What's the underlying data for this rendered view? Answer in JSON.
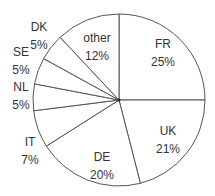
{
  "chart_data": {
    "type": "pie",
    "title": "",
    "start_angle_deg": 0,
    "direction": "clockwise",
    "slices": [
      {
        "label": "FR",
        "value": 25,
        "pct_label": "25%",
        "lx": 163,
        "ly": 48,
        "ly2": 66
      },
      {
        "label": "UK",
        "value": 21,
        "pct_label": "21%",
        "lx": 168,
        "ly": 135,
        "ly2": 153
      },
      {
        "label": "DE",
        "value": 20,
        "pct_label": "20%",
        "lx": 102,
        "ly": 161,
        "ly2": 179
      },
      {
        "label": "IT",
        "value": 7,
        "pct_label": "7%",
        "lx": 30,
        "ly": 146,
        "ly2": 164
      },
      {
        "label": "NL",
        "value": 5,
        "pct_label": "5%",
        "lx": 21,
        "ly": 91,
        "ly2": 109
      },
      {
        "label": "SE",
        "value": 5,
        "pct_label": "5%",
        "lx": 21,
        "ly": 56,
        "ly2": 74
      },
      {
        "label": "DK",
        "value": 5,
        "pct_label": "5%",
        "lx": 39,
        "ly": 31,
        "ly2": 49
      },
      {
        "label": "other",
        "value": 12,
        "pct_label": "12%",
        "lx": 97,
        "ly": 42,
        "ly2": 60
      }
    ],
    "fill": "#ffffff",
    "stroke": "#555555"
  }
}
